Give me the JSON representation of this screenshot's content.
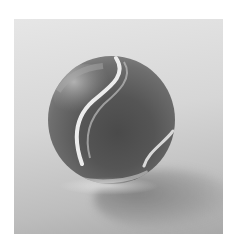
{
  "image": {
    "subject": "glass marble with swirling white stripe",
    "style": "grayscale photograph",
    "background_color": "#d6d6d6",
    "frame_color": "#ffffff",
    "ball_dark_color": "#4a4a4a",
    "stripe_color": "#e8e8e8"
  }
}
